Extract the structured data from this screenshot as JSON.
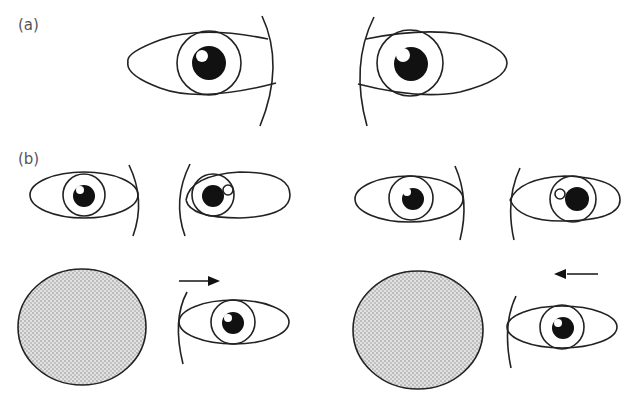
{
  "figure": {
    "panel_a": {
      "label": "(a)",
      "description": "Two large eyes facing each other, both with pupils centered"
    },
    "panel_b": {
      "label": "(b)",
      "top_row": [
        {
          "description": "Left pair: left eye pupil centered; right eye pupil shifted left with highlight on right"
        },
        {
          "description": "Right pair: left eye pupil centered; right eye pupil shifted right with highlight on left"
        }
      ],
      "bottom_row": [
        {
          "object": "grey stippled disc",
          "arrow_direction": "right",
          "eye": "single eye facing right"
        },
        {
          "object": "grey stippled disc",
          "arrow_direction": "left",
          "eye": "single eye facing right"
        }
      ]
    },
    "colors": {
      "stroke": "#222222",
      "pupil": "#111111",
      "disc_fill": "#c8c8c8",
      "label": "#555555"
    }
  }
}
